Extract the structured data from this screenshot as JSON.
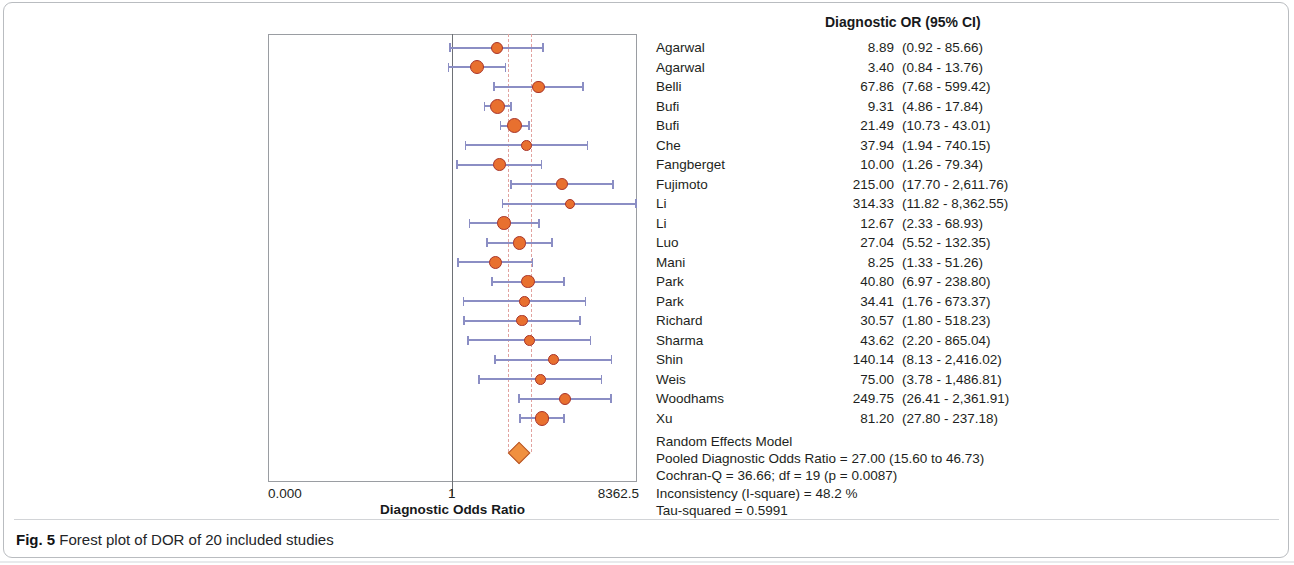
{
  "figure": {
    "caption_prefix": "Fig. 5",
    "caption_text": "Forest plot of DOR of 20 included studies"
  },
  "colors": {
    "marker_fill": "#e8702f",
    "marker_border": "#a8342a",
    "ci_line": "#8b8ec4",
    "reference_line": "#e2a3a0",
    "diamond_fill": "#f0903f",
    "axis": "#6e7176"
  },
  "table": {
    "header": "Diagnostic OR (95% CI)",
    "name_column_header": ""
  },
  "axis": {
    "title": "Diagnostic Odds Ratio",
    "ticks": [
      {
        "label": "0.000",
        "x": 268
      },
      {
        "label": "1",
        "x": 452
      },
      {
        "label": "8362.5",
        "x": 637
      }
    ],
    "min": 0.0,
    "max": 8362.5,
    "no_effect_value": 1
  },
  "chart_data": {
    "type": "forest",
    "title": "Forest plot of DOR of 20 included studies",
    "xlabel": "Diagnostic Odds Ratio",
    "ylabel": "",
    "xscale": "log",
    "xlim": [
      0.0,
      8362.5
    ],
    "grid": false,
    "legend": "none",
    "effect_measure": "Diagnostic OR (95% CI)",
    "categories": [
      "Agarwal",
      "Agarwal",
      "Belli",
      "Bufi",
      "Bufi",
      "Che",
      "Fangberget",
      "Fujimoto",
      "Li",
      "Li",
      "Luo",
      "Mani",
      "Park",
      "Park",
      "Richard",
      "Sharma",
      "Shin",
      "Weis",
      "Woodhams",
      "Xu"
    ],
    "studies": [
      {
        "name": "Agarwal",
        "or": "8.89",
        "or_value": 8.89,
        "ci": "(0.92 - 85.66)",
        "lower": 0.92,
        "upper": 85.66
      },
      {
        "name": "Agarwal",
        "or": "3.40",
        "or_value": 3.4,
        "ci": "(0.84 - 13.76)",
        "lower": 0.84,
        "upper": 13.76
      },
      {
        "name": "Belli",
        "or": "67.86",
        "or_value": 67.86,
        "ci": "(7.68 - 599.42)",
        "lower": 7.68,
        "upper": 599.42
      },
      {
        "name": "Bufi",
        "or": "9.31",
        "or_value": 9.31,
        "ci": "(4.86 - 17.84)",
        "lower": 4.86,
        "upper": 17.84
      },
      {
        "name": "Bufi",
        "or": "21.49",
        "or_value": 21.49,
        "ci": "(10.73 - 43.01)",
        "lower": 10.73,
        "upper": 43.01
      },
      {
        "name": "Che",
        "or": "37.94",
        "or_value": 37.94,
        "ci": "(1.94 - 740.15)",
        "lower": 1.94,
        "upper": 740.15
      },
      {
        "name": "Fangberget",
        "or": "10.00",
        "or_value": 10.0,
        "ci": "(1.26 - 79.34)",
        "lower": 1.26,
        "upper": 79.34
      },
      {
        "name": "Fujimoto",
        "or": "215.00",
        "or_value": 215.0,
        "ci": "(17.70 - 2,611.76)",
        "lower": 17.7,
        "upper": 2611.76
      },
      {
        "name": "Li",
        "or": "314.33",
        "or_value": 314.33,
        "ci": "(11.82 - 8,362.55)",
        "lower": 11.82,
        "upper": 8362.55
      },
      {
        "name": "Li",
        "or": "12.67",
        "or_value": 12.67,
        "ci": "(2.33 - 68.93)",
        "lower": 2.33,
        "upper": 68.93
      },
      {
        "name": "Luo",
        "or": "27.04",
        "or_value": 27.04,
        "ci": "(5.52 - 132.35)",
        "lower": 5.52,
        "upper": 132.35
      },
      {
        "name": "Mani",
        "or": "8.25",
        "or_value": 8.25,
        "ci": "(1.33 - 51.26)",
        "lower": 1.33,
        "upper": 51.26
      },
      {
        "name": "Park",
        "or": "40.80",
        "or_value": 40.8,
        "ci": "(6.97 - 238.80)",
        "lower": 6.97,
        "upper": 238.8
      },
      {
        "name": "Park",
        "or": "34.41",
        "or_value": 34.41,
        "ci": "(1.76 - 673.37)",
        "lower": 1.76,
        "upper": 673.37
      },
      {
        "name": "Richard",
        "or": "30.57",
        "or_value": 30.57,
        "ci": "(1.80 - 518.23)",
        "lower": 1.8,
        "upper": 518.23
      },
      {
        "name": "Sharma",
        "or": "43.62",
        "or_value": 43.62,
        "ci": "(2.20 - 865.04)",
        "lower": 2.2,
        "upper": 865.04
      },
      {
        "name": "Shin",
        "or": "140.14",
        "or_value": 140.14,
        "ci": "(8.13 - 2,416.02)",
        "lower": 8.13,
        "upper": 2416.02
      },
      {
        "name": "Weis",
        "or": "75.00",
        "or_value": 75.0,
        "ci": "(3.78 - 1,486.81)",
        "lower": 3.78,
        "upper": 1486.81
      },
      {
        "name": "Woodhams",
        "or": "249.75",
        "or_value": 249.75,
        "ci": "(26.41 - 2,361.91)",
        "lower": 26.41,
        "upper": 2361.91
      },
      {
        "name": "Xu",
        "or": "81.20",
        "or_value": 81.2,
        "ci": "(27.80 - 237.18)",
        "lower": 27.8,
        "upper": 237.18
      }
    ],
    "pooled": {
      "value": 27.0,
      "lower": 15.6,
      "upper": 46.73
    }
  },
  "summary": {
    "model": "Random Effects Model",
    "pooled": "Pooled Diagnostic Odds Ratio = 27.00 (15.60 to 46.73)",
    "cochran": "Cochran-Q = 36.66; df =  19 (p = 0.0087)",
    "inconsistency": "Inconsistency (I-square) = 48.2 %",
    "tau": "Tau-squared = 0.5991"
  }
}
